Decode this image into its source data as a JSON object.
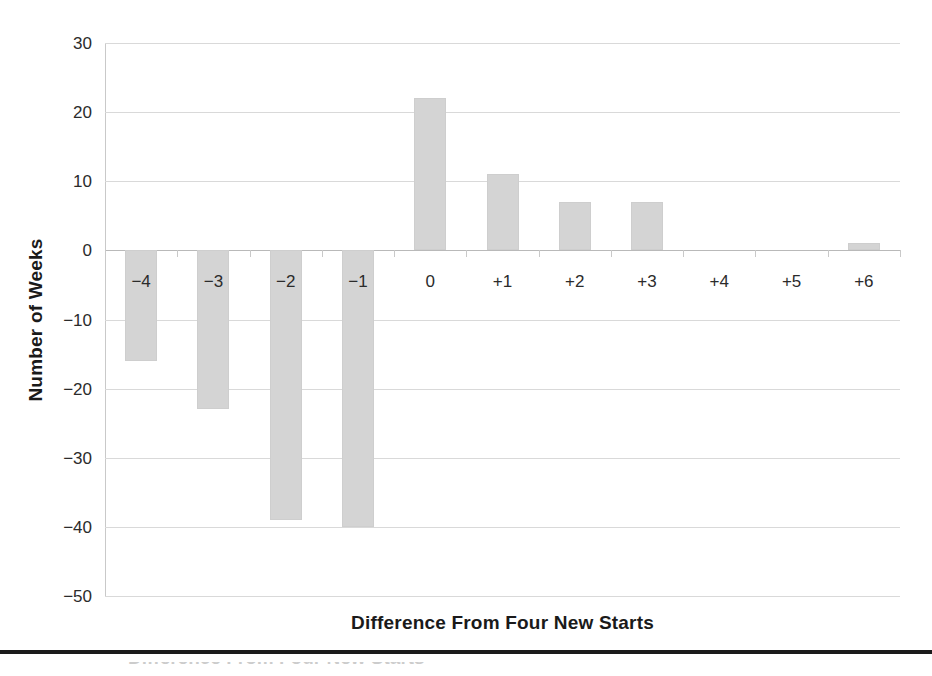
{
  "chart_data": {
    "type": "bar",
    "title": "",
    "subtitle": "",
    "xlabel": "Difference From Four New Starts",
    "ylabel": "Number of Weeks",
    "categories": [
      "-4",
      "-3",
      "-2",
      "-1",
      "0",
      "+1",
      "+2",
      "+3",
      "+4",
      "+5",
      "+6"
    ],
    "values": [
      -16,
      -23,
      -39,
      -40,
      22,
      11,
      7,
      7,
      0,
      0,
      1
    ],
    "ylim": [
      -50,
      30
    ],
    "ytick_labels": [
      "30",
      "20",
      "10",
      "0",
      "-10",
      "-20",
      "-30",
      "-40",
      "-50"
    ],
    "ytick_values": [
      30,
      20,
      10,
      0,
      -10,
      -20,
      -30,
      -40,
      -50
    ],
    "grid": "horizontal",
    "legend": "none",
    "bar_color": "#d4d4d4",
    "gridline_color": "#d9d9d9",
    "axis_color": "#c9c9c9",
    "text_color": "#231f20"
  },
  "figure": {
    "bottom_rule_color": "#1b1b1b",
    "partial_caption": "Difference From Four New Starts"
  }
}
